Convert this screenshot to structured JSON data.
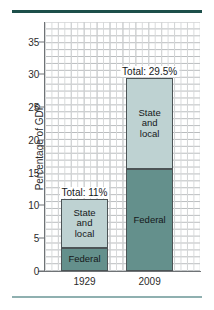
{
  "chart_data": {
    "type": "bar",
    "subtype": "stacked-bar",
    "title": "",
    "xlabel": "",
    "ylabel": "Percentage of GDP",
    "categories": [
      "1929",
      "2009"
    ],
    "ylim": [
      0,
      38
    ],
    "yticks": [
      0,
      5,
      10,
      15,
      20,
      25,
      30,
      35
    ],
    "ytick_labels": [
      "0",
      "5",
      "10",
      "15",
      "20",
      "25",
      "30",
      "35"
    ],
    "grid": true,
    "legend": "none",
    "series": [
      {
        "name": "Federal",
        "values": [
          3.5,
          15.5
        ]
      },
      {
        "name": "State and local",
        "values": [
          7.5,
          14.0
        ]
      }
    ],
    "annotations": [
      {
        "category": "1929",
        "text": "Total: 11%",
        "value": 11.0
      },
      {
        "category": "2009",
        "text": "Total: 29.5%",
        "value": 29.5
      }
    ],
    "colors": {
      "federal": "#64908c",
      "state_and_local": "#bed2d2",
      "segment_border": "#4c5456",
      "grid": "#b9bcbe",
      "axis": "#6f7376",
      "rule_top": "#1d4f4a",
      "rule_bottom": "#8fb0b0",
      "text": "#15181a"
    }
  },
  "labels": {
    "federal": "Federal",
    "state_line1": "State",
    "state_line2": "and",
    "state_line3": "local",
    "state_full": "State and local"
  }
}
